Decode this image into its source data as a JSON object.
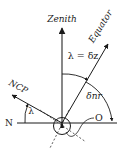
{
  "diagram": {
    "labels": {
      "zenith": "Zenith",
      "equator": "Equator",
      "ncp": "NCP",
      "north": "N",
      "lambda_eq_delta_z": "λ = δz",
      "delta_nr": "δnr",
      "lambda": "λ",
      "observer": "O"
    },
    "colors": {
      "line": "#1a1a1a",
      "background": "#ffffff"
    }
  }
}
